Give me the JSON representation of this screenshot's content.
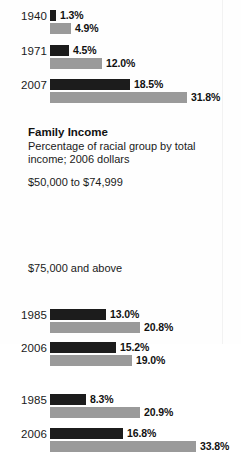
{
  "section": {
    "heading": "Family Income",
    "subtitle": "Percentage of racial group by total income; 2006 dollars"
  },
  "brackets": {
    "mid": "$50,000 to $74,999",
    "high": "$75,000 and above"
  },
  "colors": {
    "series_dark": "#1c1c1c",
    "series_light": "#9a9a9a",
    "background": "#fefefe",
    "text": "#111111"
  },
  "chart_data": {
    "type": "bar",
    "title": "Family Income",
    "subtitle": "Percentage of racial group by total income; 2006 dollars",
    "xlabel": "",
    "ylabel": "",
    "orientation": "horizontal",
    "grid": false,
    "legend": "none",
    "series": [
      {
        "name": "series-dark",
        "color": "#1c1c1c"
      },
      {
        "name": "series-light",
        "color": "#9a9a9a"
      }
    ],
    "groups": [
      {
        "bracket": "",
        "rows": [
          {
            "category": "1940",
            "dark": 1.3,
            "light": 4.9,
            "dark_label": "1.3%",
            "light_label": "4.9%"
          },
          {
            "category": "1971",
            "dark": 4.5,
            "light": 12.0,
            "dark_label": "4.5%",
            "light_label": "12.0%"
          },
          {
            "category": "2007",
            "dark": 18.5,
            "light": 31.8,
            "dark_label": "18.5%",
            "light_label": "31.8%"
          }
        ]
      },
      {
        "bracket": "$50,000 to $74,999",
        "rows": [
          {
            "category": "1985",
            "dark": 13.0,
            "light": 20.8,
            "dark_label": "13.0%",
            "light_label": "20.8%"
          },
          {
            "category": "2006",
            "dark": 15.2,
            "light": 19.0,
            "dark_label": "15.2%",
            "light_label": "19.0%"
          }
        ]
      },
      {
        "bracket": "$75,000 and above",
        "rows": [
          {
            "category": "1985",
            "dark": 8.3,
            "light": 20.9,
            "dark_label": "8.3%",
            "light_label": "20.9%"
          },
          {
            "category": "2006",
            "dark": 16.8,
            "light": 33.8,
            "dark_label": "16.8%",
            "light_label": "33.8%"
          }
        ]
      }
    ],
    "scale": {
      "px_per_percent": 4.32,
      "origin_x_px": 50
    }
  }
}
